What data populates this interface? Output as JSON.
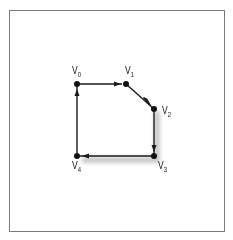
{
  "diagram": {
    "type": "directed-polygon",
    "colors": {
      "edge": "#1a1a1a",
      "node": "#111111",
      "frame": "#7a7a7a",
      "shadow": "#9a9a9a"
    },
    "nodes": [
      {
        "id": "v0",
        "label": "V",
        "sub": "0",
        "x": 77,
        "y": 84
      },
      {
        "id": "v1",
        "label": "V",
        "sub": "1",
        "x": 126,
        "y": 84
      },
      {
        "id": "v2",
        "label": "V",
        "sub": "2",
        "x": 154,
        "y": 109
      },
      {
        "id": "v3",
        "label": "V",
        "sub": "3",
        "x": 154,
        "y": 156
      },
      {
        "id": "v4",
        "label": "V",
        "sub": "4",
        "x": 77,
        "y": 156
      }
    ],
    "edges": [
      {
        "from": "v0",
        "to": "v1"
      },
      {
        "from": "v1",
        "to": "v2"
      },
      {
        "from": "v2",
        "to": "v3"
      },
      {
        "from": "v3",
        "to": "v4"
      },
      {
        "from": "v4",
        "to": "v0"
      }
    ]
  }
}
